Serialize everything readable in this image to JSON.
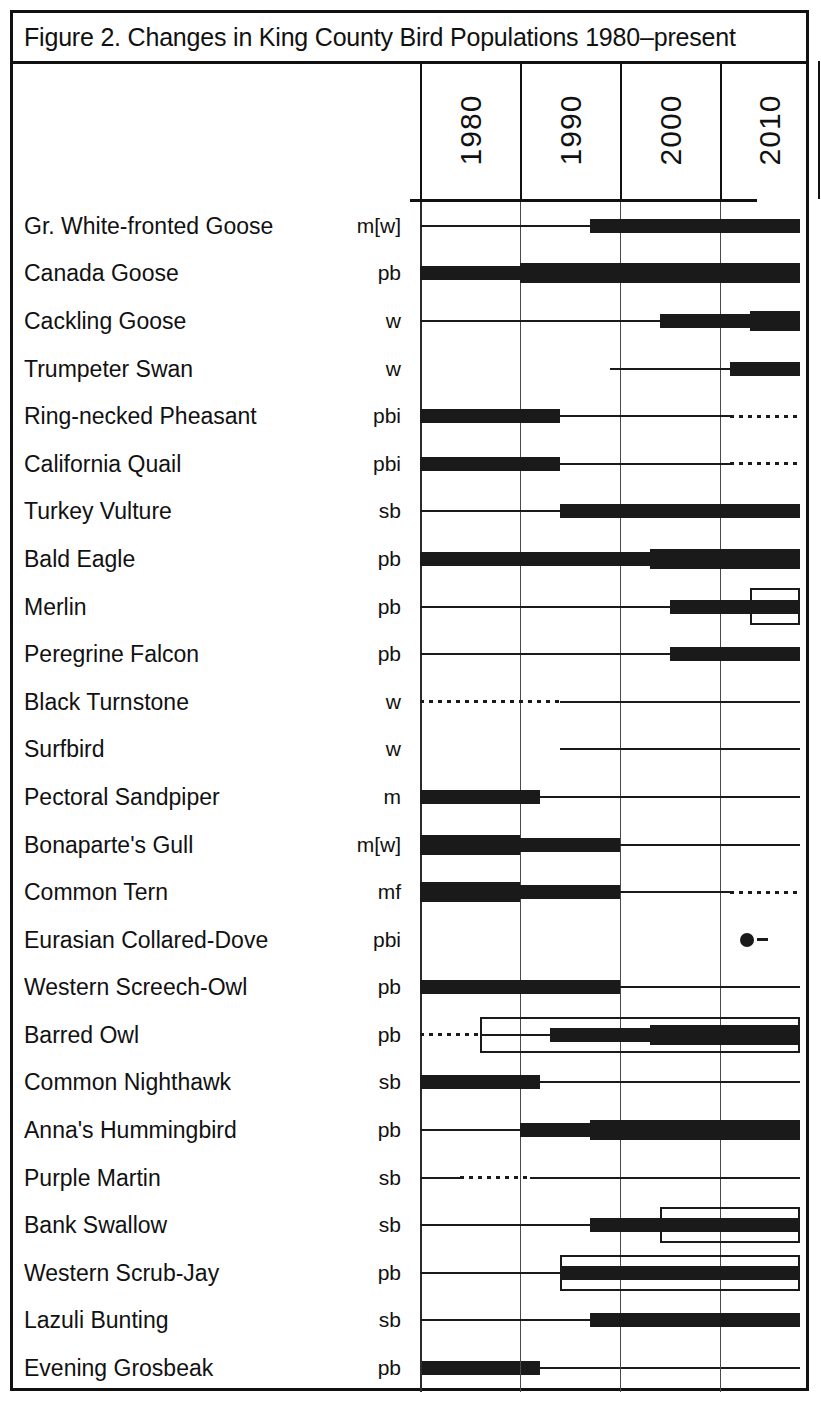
{
  "figure": {
    "title": "Figure 2. Changes in King County Bird Populations 1980–present"
  },
  "axis": {
    "year_labels": [
      "1980",
      "1990",
      "2000",
      "2010"
    ],
    "range_start": 1975,
    "range_end": 2018,
    "tick_years": [
      1980,
      1990,
      2000,
      2010
    ]
  },
  "legend_codes": {
    "p": "permanent resident",
    "b": "breeding",
    "i": "introduced",
    "m": "migrant",
    "w": "winter",
    "s": "summer",
    "f": "fall"
  },
  "chart_data": {
    "type": "bar",
    "title": "Figure 2. Changes in King County Bird Populations 1980–present",
    "xlabel": "",
    "ylabel": "",
    "xlim": [
      1975,
      2018
    ],
    "grid": true,
    "legend_position": "none",
    "xticks": [
      1980,
      1990,
      2000,
      2010
    ],
    "xticklabels": [
      "1980",
      "1990",
      "2000",
      "2010"
    ],
    "categories": [
      "Gr. White-fronted Goose",
      "Canada Goose",
      "Cackling Goose",
      "Trumpeter Swan",
      "Ring-necked Pheasant",
      "California Quail",
      "Turkey Vulture",
      "Bald Eagle",
      "Merlin",
      "Peregrine Falcon",
      "Black Turnstone",
      "Surfbird",
      "Pectoral Sandpiper",
      "Bonaparte's Gull",
      "Common Tern",
      "Eurasian Collared-Dove",
      "Western Screech-Owl",
      "Barred Owl",
      "Common Nighthawk",
      "Anna's Hummingbird",
      "Purple Martin",
      "Bank Swallow",
      "Western Scrub-Jay",
      "Lazuli Bunting",
      "Evening Grosbeak"
    ],
    "status_codes": [
      "m[w]",
      "pb",
      "w",
      "w",
      "pbi",
      "pbi",
      "sb",
      "pb",
      "pb",
      "pb",
      "w",
      "w",
      "m",
      "m[w]",
      "mf",
      "pbi",
      "pb",
      "pb",
      "sb",
      "pb",
      "sb",
      "sb",
      "pb",
      "sb",
      "pb"
    ],
    "rows": [
      {
        "name": "Gr. White-fronted Goose",
        "status": "m[w]",
        "segments": [
          {
            "from": 1980,
            "to": 1997,
            "weight": "thin"
          },
          {
            "from": 1997,
            "to": 2018,
            "weight": "thick"
          }
        ],
        "boxes": [],
        "markers": []
      },
      {
        "name": "Canada Goose",
        "status": "pb",
        "segments": [
          {
            "from": 1980,
            "to": 1990,
            "weight": "thick"
          },
          {
            "from": 1990,
            "to": 2018,
            "weight": "xthick"
          }
        ],
        "boxes": [],
        "markers": []
      },
      {
        "name": "Cackling Goose",
        "status": "w",
        "segments": [
          {
            "from": 1980,
            "to": 2004,
            "weight": "thin"
          },
          {
            "from": 2004,
            "to": 2013,
            "weight": "thick"
          },
          {
            "from": 2013,
            "to": 2018,
            "weight": "xthick"
          }
        ],
        "boxes": [],
        "markers": []
      },
      {
        "name": "Trumpeter Swan",
        "status": "w",
        "segments": [
          {
            "from": 1999,
            "to": 2011,
            "weight": "thin"
          },
          {
            "from": 2011,
            "to": 2018,
            "weight": "thick"
          }
        ],
        "boxes": [],
        "markers": []
      },
      {
        "name": "Ring-necked Pheasant",
        "status": "pbi",
        "segments": [
          {
            "from": 1980,
            "to": 1994,
            "weight": "thick"
          },
          {
            "from": 1994,
            "to": 2011,
            "weight": "thin"
          },
          {
            "from": 2011,
            "to": 2018,
            "weight": "dotted"
          }
        ],
        "boxes": [],
        "markers": []
      },
      {
        "name": "California Quail",
        "status": "pbi",
        "segments": [
          {
            "from": 1980,
            "to": 1994,
            "weight": "thick"
          },
          {
            "from": 1994,
            "to": 2011,
            "weight": "thin"
          },
          {
            "from": 2011,
            "to": 2018,
            "weight": "dotted"
          }
        ],
        "boxes": [],
        "markers": []
      },
      {
        "name": "Turkey Vulture",
        "status": "sb",
        "segments": [
          {
            "from": 1980,
            "to": 1994,
            "weight": "thin"
          },
          {
            "from": 1994,
            "to": 2018,
            "weight": "thick"
          }
        ],
        "boxes": [],
        "markers": []
      },
      {
        "name": "Bald Eagle",
        "status": "pb",
        "segments": [
          {
            "from": 1980,
            "to": 2003,
            "weight": "thick"
          },
          {
            "from": 2003,
            "to": 2018,
            "weight": "xthick"
          }
        ],
        "boxes": [],
        "markers": []
      },
      {
        "name": "Merlin",
        "status": "pb",
        "segments": [
          {
            "from": 1980,
            "to": 2005,
            "weight": "thin"
          },
          {
            "from": 2005,
            "to": 2018,
            "weight": "thick"
          }
        ],
        "boxes": [
          {
            "from": 2013,
            "to": 2018,
            "span": "tall"
          }
        ],
        "markers": []
      },
      {
        "name": "Peregrine Falcon",
        "status": "pb",
        "segments": [
          {
            "from": 1980,
            "to": 2005,
            "weight": "thin"
          },
          {
            "from": 2005,
            "to": 2018,
            "weight": "thick"
          }
        ],
        "boxes": [],
        "markers": []
      },
      {
        "name": "Black Turnstone",
        "status": "w",
        "segments": [
          {
            "from": 1980,
            "to": 1994,
            "weight": "dotted"
          },
          {
            "from": 1994,
            "to": 2018,
            "weight": "thin"
          }
        ],
        "boxes": [],
        "markers": []
      },
      {
        "name": "Surfbird",
        "status": "w",
        "segments": [
          {
            "from": 1994,
            "to": 2018,
            "weight": "thin"
          }
        ],
        "boxes": [],
        "markers": []
      },
      {
        "name": "Pectoral Sandpiper",
        "status": "m",
        "segments": [
          {
            "from": 1980,
            "to": 1992,
            "weight": "thick"
          },
          {
            "from": 1992,
            "to": 2018,
            "weight": "thin"
          }
        ],
        "boxes": [],
        "markers": []
      },
      {
        "name": "Bonaparte's Gull",
        "status": "m[w]",
        "segments": [
          {
            "from": 1980,
            "to": 1990,
            "weight": "xthick"
          },
          {
            "from": 1990,
            "to": 2000,
            "weight": "thick"
          },
          {
            "from": 2000,
            "to": 2018,
            "weight": "thin"
          }
        ],
        "boxes": [],
        "markers": []
      },
      {
        "name": "Common Tern",
        "status": "mf",
        "segments": [
          {
            "from": 1980,
            "to": 1990,
            "weight": "xthick"
          },
          {
            "from": 1990,
            "to": 2000,
            "weight": "thick"
          },
          {
            "from": 2000,
            "to": 2011,
            "weight": "thin"
          },
          {
            "from": 2011,
            "to": 2018,
            "weight": "dotted"
          }
        ],
        "boxes": [],
        "markers": []
      },
      {
        "name": "Eurasian Collared-Dove",
        "status": "pbi",
        "segments": [],
        "boxes": [],
        "markers": [
          {
            "at": 2012,
            "kind": "dot-dash"
          }
        ]
      },
      {
        "name": "Western Screech-Owl",
        "status": "pb",
        "segments": [
          {
            "from": 1980,
            "to": 2000,
            "weight": "thick"
          },
          {
            "from": 2000,
            "to": 2018,
            "weight": "thin"
          }
        ],
        "boxes": [],
        "markers": []
      },
      {
        "name": "Barred Owl",
        "status": "pb",
        "segments": [
          {
            "from": 1980,
            "to": 1986,
            "weight": "dotted"
          },
          {
            "from": 1986,
            "to": 1993,
            "weight": "thin"
          },
          {
            "from": 1993,
            "to": 2003,
            "weight": "thick"
          },
          {
            "from": 2003,
            "to": 2018,
            "weight": "xthick"
          }
        ],
        "boxes": [
          {
            "from": 1986,
            "to": 2018,
            "span": "tall"
          }
        ],
        "markers": []
      },
      {
        "name": "Common Nighthawk",
        "status": "sb",
        "segments": [
          {
            "from": 1980,
            "to": 1992,
            "weight": "thick"
          },
          {
            "from": 1992,
            "to": 2018,
            "weight": "thin"
          }
        ],
        "boxes": [],
        "markers": []
      },
      {
        "name": "Anna's Hummingbird",
        "status": "pb",
        "segments": [
          {
            "from": 1980,
            "to": 1990,
            "weight": "thin"
          },
          {
            "from": 1990,
            "to": 1997,
            "weight": "thick"
          },
          {
            "from": 1997,
            "to": 2018,
            "weight": "xthick"
          }
        ],
        "boxes": [],
        "markers": []
      },
      {
        "name": "Purple Martin",
        "status": "sb",
        "segments": [
          {
            "from": 1980,
            "to": 1984,
            "weight": "thin"
          },
          {
            "from": 1984,
            "to": 1991,
            "weight": "dotted"
          },
          {
            "from": 1991,
            "to": 2018,
            "weight": "thin"
          }
        ],
        "boxes": [],
        "markers": []
      },
      {
        "name": "Bank Swallow",
        "status": "sb",
        "segments": [
          {
            "from": 1980,
            "to": 1997,
            "weight": "thin"
          },
          {
            "from": 1997,
            "to": 2018,
            "weight": "thick"
          }
        ],
        "boxes": [
          {
            "from": 2004,
            "to": 2018,
            "span": "tall"
          }
        ],
        "markers": []
      },
      {
        "name": "Western Scrub-Jay",
        "status": "pb",
        "segments": [
          {
            "from": 1980,
            "to": 1994,
            "weight": "thin"
          },
          {
            "from": 1994,
            "to": 2018,
            "weight": "thick"
          }
        ],
        "boxes": [
          {
            "from": 1994,
            "to": 2018,
            "span": "tall"
          }
        ],
        "markers": []
      },
      {
        "name": "Lazuli Bunting",
        "status": "sb",
        "segments": [
          {
            "from": 1980,
            "to": 1997,
            "weight": "thin"
          },
          {
            "from": 1997,
            "to": 2018,
            "weight": "thick"
          }
        ],
        "boxes": [],
        "markers": []
      },
      {
        "name": "Evening Grosbeak",
        "status": "pb",
        "segments": [
          {
            "from": 1980,
            "to": 1992,
            "weight": "thick"
          },
          {
            "from": 1992,
            "to": 2018,
            "weight": "thin"
          }
        ],
        "boxes": [],
        "markers": []
      }
    ]
  }
}
